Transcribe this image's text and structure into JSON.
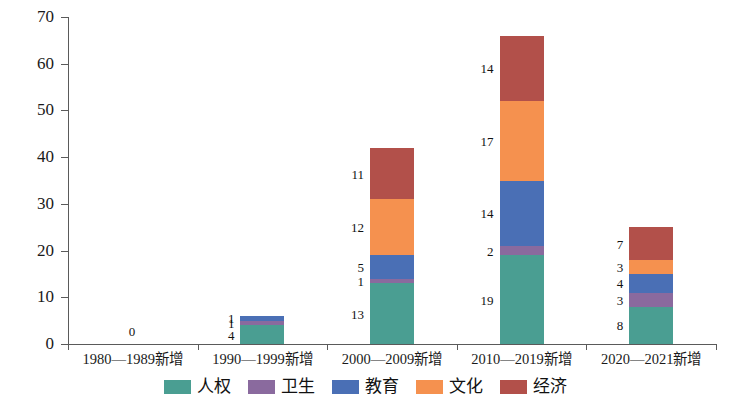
{
  "chart_data": {
    "type": "bar",
    "subtype": "stacked-vertical",
    "title": "",
    "xlabel": "",
    "ylabel": "",
    "ylim": [
      0,
      70
    ],
    "ytick_values": [
      0,
      10,
      20,
      30,
      40,
      50,
      60,
      70
    ],
    "ytick_labels": [
      "0",
      "10",
      "20",
      "30",
      "40",
      "50",
      "60",
      "70"
    ],
    "grid": false,
    "legend_position": "bottom-center",
    "categories": [
      "1980—1989新增",
      "1990—1999新增",
      "2000—2009新增",
      "2010—2019新增",
      "2020—2021新增"
    ],
    "series": [
      {
        "name": "人权",
        "color": "#4a9e92",
        "values": [
          0,
          4,
          13,
          19,
          8
        ]
      },
      {
        "name": "卫生",
        "color": "#8a6a9e",
        "values": [
          0,
          1,
          1,
          2,
          3
        ]
      },
      {
        "name": "教育",
        "color": "#4a6fb5",
        "values": [
          0,
          1,
          5,
          14,
          4
        ]
      },
      {
        "name": "文化",
        "color": "#f5914f",
        "values": [
          0,
          0,
          12,
          17,
          3
        ]
      },
      {
        "name": "经济",
        "color": "#b2504a",
        "values": [
          0,
          0,
          11,
          14,
          7
        ]
      }
    ],
    "totals": [
      0,
      6,
      42,
      66,
      25
    ],
    "bar_labels": [
      {
        "category": "1980—1989新增",
        "labels": [
          "0"
        ]
      },
      {
        "category": "1990—1999新增",
        "labels": [
          "4",
          "1"
        ]
      },
      {
        "category": "2000—2009新增",
        "labels": [
          "13",
          "1",
          "5",
          "12",
          "11"
        ]
      },
      {
        "category": "2010—2019新增",
        "labels": [
          "19",
          "2",
          "14",
          "17",
          "14"
        ]
      },
      {
        "category": "2020—2021新增",
        "labels": [
          "8",
          "3",
          "4",
          "3",
          "7"
        ]
      }
    ],
    "zero_marker": "0"
  },
  "legend": {
    "items": [
      {
        "label": "人权",
        "color": "#4a9e92"
      },
      {
        "label": "卫生",
        "color": "#8a6a9e"
      },
      {
        "label": "教育",
        "color": "#4a6fb5"
      },
      {
        "label": "文化",
        "color": "#f5914f"
      },
      {
        "label": "经济",
        "color": "#b2504a"
      }
    ]
  },
  "axis": {
    "y_ticks": [
      "0",
      "10",
      "20",
      "30",
      "40",
      "50",
      "60",
      "70"
    ],
    "x_ticks": [
      "1980—1989新增",
      "1990—1999新增",
      "2000—2009新增",
      "2010—2019新增",
      "2020—2021新增"
    ]
  }
}
